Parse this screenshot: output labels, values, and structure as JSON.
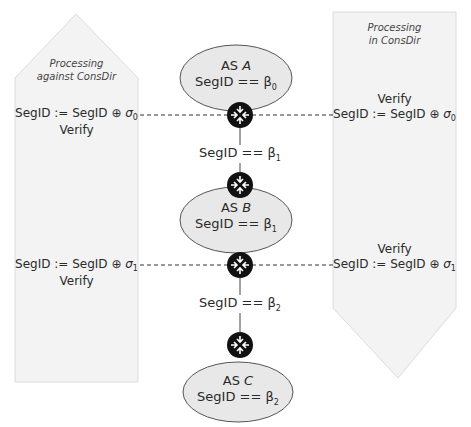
{
  "left_panel": {
    "title_line1": "Processing",
    "title_line2": "against ConsDir",
    "step0_op_prefix": "SegID := SegID ⊕ ",
    "step0_sigma": "σ",
    "step0_sub": "0",
    "step0_verify": "Verify",
    "step1_op_prefix": "SegID := SegID ⊕ ",
    "step1_sigma": "σ",
    "step1_sub": "1",
    "step1_verify": "Verify"
  },
  "right_panel": {
    "title_line1": "Processing",
    "title_line2": "in ConsDir",
    "step0_verify": "Verify",
    "step0_op_prefix": "SegID := SegID ⊕ ",
    "step0_sigma": "σ",
    "step0_sub": "0",
    "step1_verify": "Verify",
    "step1_op_prefix": "SegID := SegID ⊕ ",
    "step1_sigma": "σ",
    "step1_sub": "1"
  },
  "ases": [
    {
      "prefix": "AS ",
      "name": "A",
      "cond": "SegID == β",
      "sub": "0"
    },
    {
      "prefix": "AS ",
      "name": "B",
      "cond": "SegID == β",
      "sub": "1"
    },
    {
      "prefix": "AS ",
      "name": "C",
      "cond": "SegID == β",
      "sub": "2"
    }
  ],
  "links": [
    {
      "cond": "SegID == β",
      "sub": "1"
    },
    {
      "cond": "SegID == β",
      "sub": "2"
    }
  ],
  "icons": {
    "router": "router-icon"
  },
  "colors": {
    "panel_fill": "#f2f2f2",
    "panel_stroke": "#d8d8d8",
    "ellipse_fill": "#e6e6e6",
    "ellipse_stroke": "#555555",
    "router": "#111111"
  }
}
